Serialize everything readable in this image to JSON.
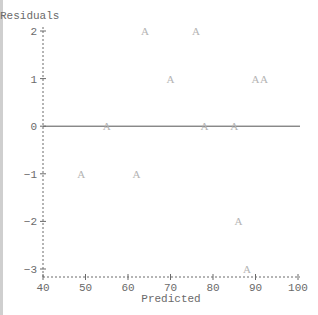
{
  "chart_data": {
    "type": "scatter",
    "title": "",
    "xlabel": "Predicted",
    "ylabel": "Residuals",
    "xlim": [
      40,
      100
    ],
    "ylim": [
      -3,
      2
    ],
    "x_ticks": [
      "40",
      "50",
      "60",
      "70",
      "80",
      "90",
      "100"
    ],
    "y_ticks": [
      "2",
      "1",
      "0",
      "−1",
      "−2",
      "−3"
    ],
    "grid": false,
    "reference_line": {
      "y": 0
    },
    "marker": "A",
    "series": [
      {
        "name": "A",
        "points": [
          {
            "x": 64,
            "y": 2
          },
          {
            "x": 76,
            "y": 2
          },
          {
            "x": 70,
            "y": 1
          },
          {
            "x": 90,
            "y": 1
          },
          {
            "x": 92,
            "y": 1
          },
          {
            "x": 55,
            "y": 0
          },
          {
            "x": 78,
            "y": 0
          },
          {
            "x": 85,
            "y": 0
          },
          {
            "x": 49,
            "y": -1
          },
          {
            "x": 62,
            "y": -1
          },
          {
            "x": 86,
            "y": -2
          },
          {
            "x": 88,
            "y": -3
          }
        ]
      }
    ],
    "colors": {
      "axis": "#6a6a6a",
      "points": "#b4b4b4",
      "zero_line": "#555555"
    }
  }
}
